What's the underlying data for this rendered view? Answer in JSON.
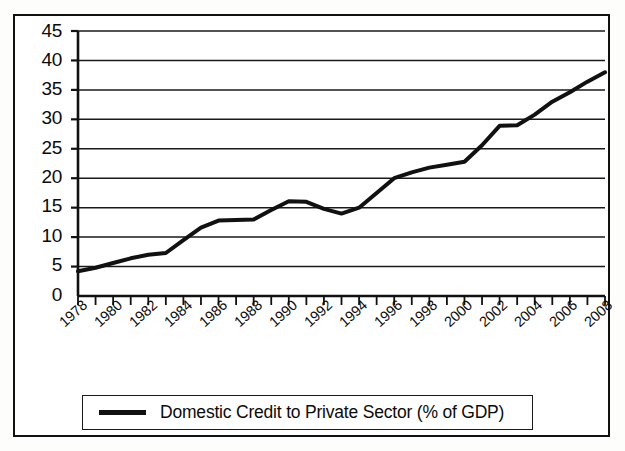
{
  "chart_data": {
    "type": "line",
    "title": "",
    "xlabel": "",
    "ylabel": "",
    "ylim": [
      0,
      45
    ],
    "xlim": [
      1978,
      2008
    ],
    "ytick_step": 5,
    "yticks": [
      45,
      40,
      35,
      30,
      25,
      20,
      15,
      10,
      5,
      0
    ],
    "xticks": [
      1978,
      1980,
      1982,
      1984,
      1986,
      1988,
      1990,
      1992,
      1994,
      1996,
      1998,
      2000,
      2002,
      2004,
      2006,
      2008
    ],
    "xtick_minor_every": 1,
    "grid": "horizontal",
    "legend_position": "bottom",
    "line_color": "#111111",
    "line_width": 4,
    "series": [
      {
        "name": "Domestic Credit to Private Sector (% of GDP)",
        "x": [
          1978,
          1979,
          1980,
          1981,
          1982,
          1983,
          1984,
          1985,
          1986,
          1987,
          1988,
          1989,
          1990,
          1991,
          1992,
          1993,
          1994,
          1995,
          1996,
          1997,
          1998,
          1999,
          2000,
          2001,
          2002,
          2003,
          2004,
          2005,
          2006,
          2007,
          2008
        ],
        "values": [
          4.2,
          4.8,
          5.6,
          6.4,
          7.0,
          7.3,
          9.5,
          11.6,
          12.8,
          12.9,
          13.0,
          14.6,
          16.1,
          16.0,
          14.8,
          14.0,
          15.0,
          17.5,
          20.0,
          21.0,
          21.8,
          22.3,
          22.8,
          25.6,
          28.9,
          29.0,
          30.8,
          33.0,
          34.6,
          36.4,
          38.0
        ]
      }
    ]
  },
  "axis": {
    "y_tick_labels": [
      "45",
      "40",
      "35",
      "30",
      "25",
      "20",
      "15",
      "10",
      "5",
      "0"
    ],
    "x_tick_labels": [
      "1978",
      "1980",
      "1982",
      "1984",
      "1986",
      "1988",
      "1990",
      "1992",
      "1994",
      "1996",
      "1998",
      "2000",
      "2002",
      "2004",
      "2006",
      "2008"
    ]
  },
  "legend": {
    "entries": [
      {
        "label": "Domestic Credit to Private Sector (% of GDP)",
        "color": "#111111"
      }
    ]
  }
}
